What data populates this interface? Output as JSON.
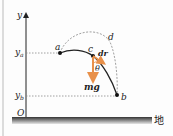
{
  "diagram": {
    "axis": {
      "y_label": "y",
      "origin_label": "O",
      "ya_label": "y",
      "ya_sub": "a",
      "yb_label": "y",
      "yb_sub": "b"
    },
    "points": {
      "a": "a",
      "b": "b",
      "c": "c",
      "d": "d"
    },
    "vectors": {
      "displacement": "dr",
      "gravity": "mg",
      "angle": "θ"
    },
    "ground_label": "地",
    "colors": {
      "accent": "#e8904a",
      "line": "#222222",
      "dashed": "#888888"
    }
  }
}
